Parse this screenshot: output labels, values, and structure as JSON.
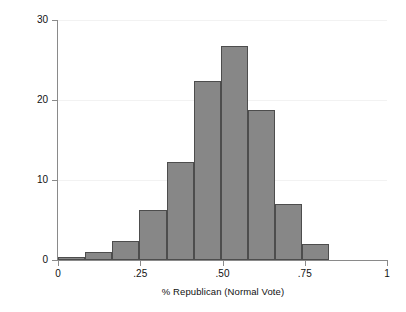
{
  "chart_data": {
    "type": "bar",
    "title": "",
    "xlabel": "% Republican (Normal Vote)",
    "ylabel": "Percent of Cases",
    "xlim": [
      0,
      1
    ],
    "ylim": [
      0,
      30
    ],
    "grid": true,
    "legend": "none",
    "bin_width": 0.0825,
    "bin_starts": [
      0.0,
      0.0825,
      0.165,
      0.2475,
      0.33,
      0.4125,
      0.495,
      0.5775,
      0.66,
      0.7425
    ],
    "categories": [
      "0.000",
      "0.083",
      "0.165",
      "0.248",
      "0.330",
      "0.413",
      "0.495",
      "0.578",
      "0.660",
      "0.743"
    ],
    "values": [
      0.4,
      1.0,
      2.4,
      6.2,
      12.3,
      22.4,
      26.7,
      18.8,
      7.0,
      2.0
    ],
    "xticks": [
      {
        "value": 0,
        "label": "0"
      },
      {
        "value": 0.25,
        "label": ".25"
      },
      {
        "value": 0.5,
        "label": ".50"
      },
      {
        "value": 0.75,
        "label": ".75"
      },
      {
        "value": 1,
        "label": "1"
      }
    ],
    "yticks": [
      {
        "value": 0,
        "label": "0"
      },
      {
        "value": 10,
        "label": "10"
      },
      {
        "value": 20,
        "label": "20"
      },
      {
        "value": 30,
        "label": "30"
      }
    ],
    "colors": {
      "bar_fill": "#878787",
      "bar_edge": "#4d4d4d",
      "axis": "#8a8a8a",
      "grid": "#f2f2f2",
      "text": "#111111",
      "background": "#ffffff"
    }
  },
  "caption": {
    "sliver_text": ""
  }
}
